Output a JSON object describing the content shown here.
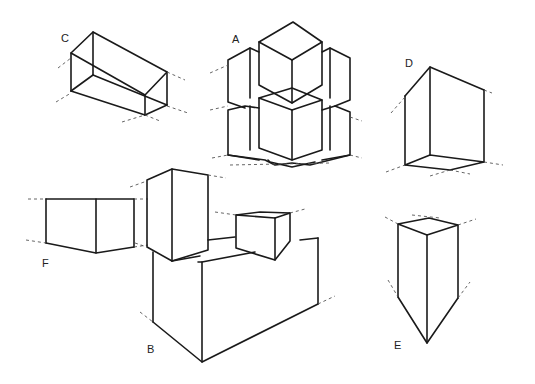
{
  "figure": {
    "type": "perspective box drawings",
    "labels": {
      "A": "A",
      "B": "B",
      "C": "C",
      "D": "D",
      "E": "E",
      "F": "F"
    },
    "colors": {
      "line": "#1a1a1a",
      "guide": "#555555",
      "background": "#ffffff"
    }
  }
}
